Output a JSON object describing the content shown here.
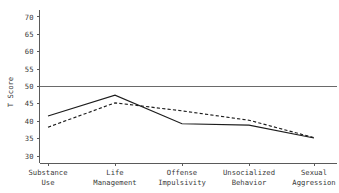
{
  "chart_data": {
    "type": "line",
    "title": "",
    "xlabel": "",
    "ylabel": "T Score",
    "categories": [
      "Substance\nUse",
      "Life\nManagement",
      "Offense\nImpulsivity",
      "Unsocialized\nBehavior",
      "Sexual\nAggression"
    ],
    "category_lines": [
      [
        "Substance",
        "Use"
      ],
      [
        "Life",
        "Management"
      ],
      [
        "Offense",
        "Impulsivity"
      ],
      [
        "Unsocialized",
        "Behavior"
      ],
      [
        "Sexual",
        "Aggression"
      ]
    ],
    "ylim": [
      28,
      72
    ],
    "yticks": [
      30,
      35,
      40,
      45,
      50,
      55,
      60,
      65,
      70
    ],
    "ytick_labels": [
      "30",
      "35",
      "40",
      "45",
      "50",
      "55",
      "60",
      "65",
      "70"
    ],
    "grid": false,
    "legend": "none",
    "reference_line": {
      "value": 50,
      "label": "",
      "color": "#6a6a6a"
    },
    "series": [
      {
        "name": "solid",
        "style": "solid",
        "color": "#1d1d1d",
        "values": [
          41.5,
          47.5,
          39.3,
          38.9,
          35.2
        ]
      },
      {
        "name": "dashed",
        "style": "dashed",
        "color": "#1d1d1d",
        "values": [
          38.3,
          45.3,
          43.0,
          40.3,
          35.3
        ]
      }
    ]
  },
  "axis": {
    "y_title": "T Score",
    "axis_color": "#5a5a5a"
  }
}
